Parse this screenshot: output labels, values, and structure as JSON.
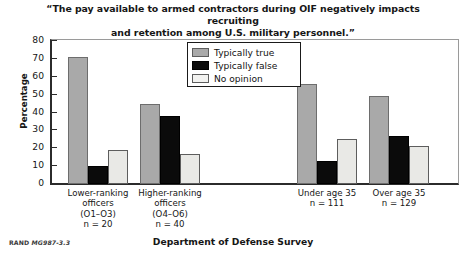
{
  "chart_data": {
    "type": "bar",
    "title": "“The pay available to armed contractors during OIF negatively impacts recruiting and retention among U.S. military personnel.”",
    "title_line1": "“The pay available to armed contractors during OIF negatively impacts recruiting",
    "title_line2": "and retention among U.S. military personnel.”",
    "xlabel": "Department of Defense Survey",
    "ylabel": "Percentage",
    "ylim": [
      0,
      80
    ],
    "yticks": [
      0,
      10,
      20,
      30,
      40,
      50,
      60,
      70,
      80
    ],
    "grid": false,
    "legend_position": "inside-top-center",
    "categories": [
      {
        "lines": [
          "Lower-ranking",
          "officers",
          "(O1–O3)",
          "n = 20"
        ],
        "n": 20
      },
      {
        "lines": [
          "Higher-ranking",
          "officers",
          "(O4–O6)",
          "n = 40"
        ],
        "n": 40
      },
      {
        "lines": [
          "Under age 35",
          "n = 111"
        ],
        "n": 111
      },
      {
        "lines": [
          "Over age 35",
          "n = 129"
        ],
        "n": 129
      }
    ],
    "series": [
      {
        "name": "Typically true",
        "color": "#a9a9a9",
        "values": [
          71,
          45,
          56,
          49
        ]
      },
      {
        "name": "Typically false",
        "color": "#0b0b0b",
        "values": [
          10,
          38,
          13,
          27
        ]
      },
      {
        "name": "No opinion",
        "color": "#e9e9e6",
        "values": [
          19,
          17,
          25,
          21
        ]
      }
    ]
  },
  "legend": {
    "items": [
      {
        "label": "Typically true",
        "swatch": "true"
      },
      {
        "label": "Typically false",
        "swatch": "false"
      },
      {
        "label": "No opinion",
        "swatch": "none"
      }
    ]
  },
  "source_note": {
    "prefix": "RAND",
    "id": "MG987-3.3"
  }
}
